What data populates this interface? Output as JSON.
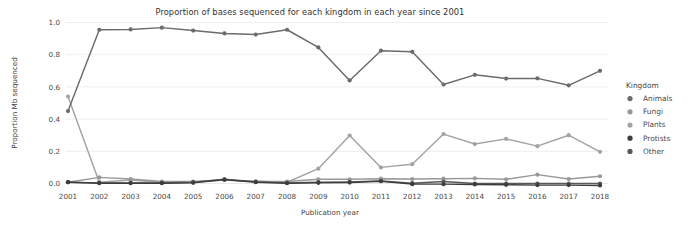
{
  "chart_data": {
    "type": "line",
    "title": "Proportion of bases sequenced for each kingdom in each year since 2001",
    "xlabel": "Publication year",
    "ylabel": "Proportion Mb sequenced",
    "legend_title": "Kingdom",
    "legend_position": "right",
    "grid": true,
    "xlim": [
      2001,
      2018
    ],
    "ylim": [
      0.0,
      1.0
    ],
    "yticks": [
      "0.0",
      "0.2",
      "0.4",
      "0.6",
      "0.8",
      "1.0"
    ],
    "ytick_values": [
      0.0,
      0.2,
      0.4,
      0.6,
      0.8,
      1.0
    ],
    "categories": [
      "2001",
      "2002",
      "2003",
      "2004",
      "2005",
      "2006",
      "2007",
      "2008",
      "2009",
      "2010",
      "2011",
      "2012",
      "2013",
      "2014",
      "2015",
      "2016",
      "2017",
      "2018"
    ],
    "x": [
      2001,
      2002,
      2003,
      2004,
      2005,
      2006,
      2007,
      2008,
      2009,
      2010,
      2011,
      2012,
      2013,
      2014,
      2015,
      2016,
      2017,
      2018
    ],
    "series": [
      {
        "name": "Animals",
        "color": "#6b6b6b",
        "values": [
          0.45,
          0.955,
          0.957,
          0.968,
          0.95,
          0.932,
          0.925,
          0.955,
          0.845,
          0.64,
          0.825,
          0.818,
          0.615,
          0.675,
          0.652,
          0.653,
          0.61,
          0.7
        ]
      },
      {
        "name": "Fungi",
        "color": "#989898",
        "values": [
          0.008,
          0.038,
          0.028,
          0.012,
          0.012,
          0.022,
          0.012,
          0.012,
          0.026,
          0.026,
          0.03,
          0.028,
          0.03,
          0.032,
          0.026,
          0.055,
          0.028,
          0.045
        ]
      },
      {
        "name": "Plants",
        "color": "#a3a3a3",
        "values": [
          0.54,
          0.008,
          0.022,
          0.006,
          0.008,
          0.022,
          0.014,
          0.008,
          0.092,
          0.298,
          0.1,
          0.12,
          0.307,
          0.245,
          0.277,
          0.232,
          0.3,
          0.197
        ]
      },
      {
        "name": "Protists",
        "color": "#3d3d3d",
        "values": [
          0.008,
          0.002,
          0.002,
          0.002,
          0.004,
          0.024,
          0.008,
          0.002,
          0.004,
          0.006,
          0.014,
          -0.004,
          -0.004,
          -0.006,
          -0.008,
          -0.01,
          -0.01,
          -0.012
        ]
      },
      {
        "name": "Other",
        "color": "#585858",
        "values": [
          0.008,
          0.004,
          0.004,
          0.004,
          0.008,
          0.026,
          0.01,
          0.004,
          0.008,
          0.01,
          0.016,
          0.002,
          0.012,
          0.0,
          0.0,
          0.0,
          0.0,
          0.0
        ]
      }
    ],
    "legend_entries": [
      {
        "label": "Animals",
        "color": "#6b6b6b"
      },
      {
        "label": "Fungi",
        "color": "#989898"
      },
      {
        "label": "Plants",
        "color": "#a3a3a3"
      },
      {
        "label": "Protists",
        "color": "#3d3d3d"
      },
      {
        "label": "Other",
        "color": "#585858"
      }
    ]
  }
}
